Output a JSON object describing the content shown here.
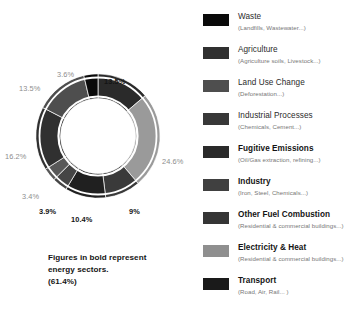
{
  "chart_data": {
    "type": "pie",
    "title": "",
    "subtitle": "",
    "xlabel": "",
    "ylabel": "",
    "legend_position": "right",
    "grid": false,
    "note": "Doughnut chart of global greenhouse gas emissions by sector. Bold figures are energy sectors totalling 61.4%.",
    "categories": [
      "Fugitive Emissions",
      "Electricity & Heat",
      "Other Fuel Combustion",
      "Transport",
      "Industry",
      "Industrial Processes",
      "Agriculture",
      "Land Use Change",
      "Waste"
    ],
    "values": [
      13.5,
      24.6,
      9,
      10.4,
      3.9,
      3.4,
      16.2,
      13.5,
      3.6
    ],
    "labels": [
      "13.5%",
      "24.6%",
      "9%",
      "10.4%",
      "3.9%",
      "3.4%",
      "16.2%",
      "13.5%",
      "3.6%"
    ],
    "energy_sector_flags": [
      true,
      true,
      true,
      true,
      true,
      false,
      false,
      false,
      false
    ],
    "energy_total": "61.4%",
    "colors": [
      "#2a2a2a",
      "#9a9a9a",
      "#3a3a3a",
      "#202020",
      "#454545",
      "#585858",
      "#303030",
      "#4e4e4e",
      "#0a0a0a"
    ]
  },
  "callouts": [
    {
      "text": "3.6%",
      "style": "gray",
      "left": 57,
      "top": 71
    },
    {
      "text": "13.5%",
      "style": "bold",
      "left": 104,
      "top": 78
    },
    {
      "text": "13.5%",
      "style": "gray",
      "left": 19,
      "top": 85
    },
    {
      "text": "24.6%",
      "style": "gray",
      "left": 162,
      "top": 158
    },
    {
      "text": "16.2%",
      "style": "gray",
      "left": 5,
      "top": 153
    },
    {
      "text": "3.4%",
      "style": "gray",
      "left": 22,
      "top": 193
    },
    {
      "text": "3.9%",
      "style": "bold",
      "left": 39,
      "top": 208
    },
    {
      "text": "10.4%",
      "style": "bold",
      "left": 71,
      "top": 216
    },
    {
      "text": "9%",
      "style": "bold",
      "left": 129,
      "top": 208
    }
  ],
  "caption": {
    "line1": "Figures in bold represent",
    "line2": "energy sectors.",
    "line3": "(61.4%)"
  },
  "legend": {
    "items": [
      {
        "title": "Waste",
        "subtitle": "(Landfills, Wastewater...)",
        "color": "#0a0a0a",
        "energy": false
      },
      {
        "title": "Agriculture",
        "subtitle": "(Agriculture soils, Livestock...)",
        "color": "#303030",
        "energy": false
      },
      {
        "title": "Land Use Change",
        "subtitle": "(Deforestation...)",
        "color": "#4e4e4e",
        "energy": false
      },
      {
        "title": "Industrial Processes",
        "subtitle": "(Chemicals, Cement...)",
        "color": "#383838",
        "energy": false
      },
      {
        "title": "Fugitive Emissions",
        "subtitle": "(Oil/Gas extraction, refining...)",
        "color": "#2a2a2a",
        "energy": true
      },
      {
        "title": "Industry",
        "subtitle": "(Iron, Steel, Chemicals...)",
        "color": "#404040",
        "energy": true
      },
      {
        "title": "Other Fuel Combustion",
        "subtitle": "(Residential & commercial buildings...)",
        "color": "#353535",
        "energy": true
      },
      {
        "title": "Electricity & Heat",
        "subtitle": "(Residential & commercial buildings...)",
        "color": "#8f8f8f",
        "energy": true
      },
      {
        "title": "Transport",
        "subtitle": "(Road, Air, Rail... )",
        "color": "#1a1a1a",
        "energy": true
      }
    ]
  }
}
